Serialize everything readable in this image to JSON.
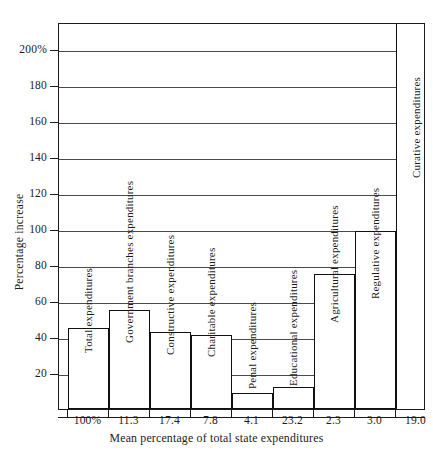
{
  "chart_data": {
    "type": "bar",
    "title": "",
    "xlabel": "Mean percentage of total state expenditures",
    "ylabel": "Percentage  increase",
    "ylim": [
      0,
      215
    ],
    "grid": true,
    "legend": "none",
    "yticks": [
      20,
      40,
      60,
      80,
      100,
      120,
      140,
      160,
      180,
      200
    ],
    "ytick_labels": [
      "20",
      "40",
      "60",
      "80",
      "100",
      "120",
      "140",
      "160",
      "180",
      "200%"
    ],
    "categories": [
      "100%",
      "11.3",
      "17.4",
      "7.8",
      "4.1",
      "23.2",
      "2.3",
      "3.0",
      "19.0"
    ],
    "bar_labels": [
      "Total expenditures",
      "Government branches expenditures",
      "Constructive expenditures",
      "Charitable expenditures",
      "Penal expenditures",
      "Educational expenditures",
      "Agricultural expenditures",
      "Regulative expenditures",
      "Curative expenditures"
    ],
    "values": [
      45,
      55,
      43,
      41,
      9,
      12,
      75,
      99,
      215
    ],
    "colors": {
      "bar_fill": "#ffffff",
      "bar_outline": "#111111",
      "gridline": "#4b4b4b",
      "frame": "#1b1b1b",
      "text": "#1b1b1b"
    }
  },
  "bars": [
    {
      "label": "Total expenditures",
      "tick": "100%",
      "value": 45,
      "left": 9,
      "width": 41,
      "cap_bottom_offset": 56,
      "overflow": false
    },
    {
      "label": "Government branches expenditures",
      "tick": "11.3",
      "value": 55,
      "left": 50,
      "width": 41,
      "cap_bottom_offset": 66,
      "overflow": false
    },
    {
      "label": "Constructive expenditures",
      "tick": "17.4",
      "value": 43,
      "left": 91,
      "width": 41,
      "cap_bottom_offset": 54,
      "overflow": false
    },
    {
      "label": "Charitable expenditures",
      "tick": "7.8",
      "value": 41,
      "left": 132,
      "width": 41,
      "cap_bottom_offset": 52,
      "overflow": false
    },
    {
      "label": "Penal expenditures",
      "tick": "4.1",
      "value": 9,
      "left": 173,
      "width": 41,
      "cap_bottom_offset": 20,
      "overflow": false
    },
    {
      "label": "Educational expenditures",
      "tick": "23.2",
      "value": 12,
      "left": 214,
      "width": 41,
      "cap_bottom_offset": 23,
      "overflow": false
    },
    {
      "label": "Agricultural expenditures",
      "tick": "2.3",
      "value": 75,
      "left": 255,
      "width": 41,
      "cap_bottom_offset": 86,
      "overflow": false
    },
    {
      "label": "Regulative expenditures",
      "tick": "3.0",
      "value": 99,
      "left": 296,
      "width": 41,
      "cap_bottom_offset": 110,
      "overflow": false
    },
    {
      "label": "Curative expenditures",
      "tick": "19.0",
      "value": 215,
      "left": 337,
      "width": 41,
      "cap_bottom_offset": 231,
      "overflow": true
    }
  ]
}
